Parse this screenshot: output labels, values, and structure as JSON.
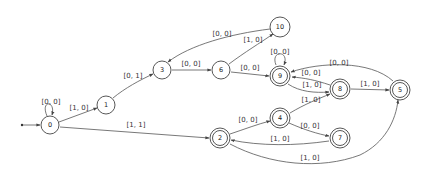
{
  "diagram": {
    "type": "state-machine",
    "nodes": [
      {
        "id": "0",
        "label": "0",
        "x": 50,
        "y": 125,
        "accepting": false,
        "initial": true
      },
      {
        "id": "1",
        "label": "1",
        "x": 106,
        "y": 105,
        "accepting": false
      },
      {
        "id": "3",
        "label": "3",
        "x": 162,
        "y": 70,
        "accepting": false
      },
      {
        "id": "6",
        "label": "6",
        "x": 221,
        "y": 70,
        "accepting": false
      },
      {
        "id": "10",
        "label": "10",
        "x": 280,
        "y": 27,
        "accepting": false
      },
      {
        "id": "9",
        "label": "9",
        "x": 280,
        "y": 76,
        "accepting": true
      },
      {
        "id": "8",
        "label": "8",
        "x": 340,
        "y": 89,
        "accepting": true
      },
      {
        "id": "5",
        "label": "5",
        "x": 400,
        "y": 90,
        "accepting": true
      },
      {
        "id": "2",
        "label": "2",
        "x": 220,
        "y": 138,
        "accepting": true
      },
      {
        "id": "4",
        "label": "4",
        "x": 280,
        "y": 118,
        "accepting": true
      },
      {
        "id": "7",
        "label": "7",
        "x": 340,
        "y": 138,
        "accepting": true
      }
    ],
    "edges": [
      {
        "from": "0",
        "to": "0",
        "label": "[0, 0]"
      },
      {
        "from": "0",
        "to": "1",
        "label": "[1, 0]"
      },
      {
        "from": "0",
        "to": "2",
        "label": "[1, 1]"
      },
      {
        "from": "1",
        "to": "3",
        "label": "[0, 1]"
      },
      {
        "from": "3",
        "to": "6",
        "label": "[0, 0]"
      },
      {
        "from": "10",
        "to": "3",
        "label": "[0, 0]"
      },
      {
        "from": "6",
        "to": "10",
        "label": "[1, 0]"
      },
      {
        "from": "6",
        "to": "9",
        "label": "[0, 0]"
      },
      {
        "from": "9",
        "to": "9",
        "label": "[0, 0]"
      },
      {
        "from": "9",
        "to": "8",
        "label": "[1, 0]"
      },
      {
        "from": "8",
        "to": "9",
        "label": "[0, 0]"
      },
      {
        "from": "5",
        "to": "9",
        "label": "[0, 0]"
      },
      {
        "from": "8",
        "to": "5",
        "label": "[1, 0]"
      },
      {
        "from": "4",
        "to": "8",
        "label": "[1, 0]"
      },
      {
        "from": "2",
        "to": "4",
        "label": "[0, 0]"
      },
      {
        "from": "4",
        "to": "7",
        "label": "[0, 0]"
      },
      {
        "from": "7",
        "to": "2",
        "label": "[1, 0]"
      },
      {
        "from": "2",
        "to": "5",
        "label": "[1, 0]"
      }
    ]
  }
}
